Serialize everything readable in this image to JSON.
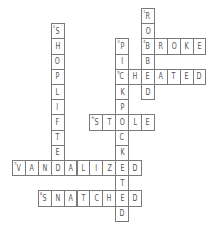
{
  "puzzle": {
    "grid": {
      "origin_x": 12,
      "origin_y": 8,
      "cell_w": 12.9,
      "cell_h": 15.2
    },
    "colors": {
      "border": "#7a7a7a",
      "letter": "#555555",
      "background": "#ffffff"
    },
    "words": [
      {
        "number": "1",
        "answer": "ROBBED",
        "direction": "down",
        "row": 0,
        "col": 10
      },
      {
        "number": "2",
        "answer": "SHOPLIFTED",
        "direction": "down",
        "row": 1,
        "col": 3
      },
      {
        "number": "3",
        "answer": "PICKPOCKETED",
        "direction": "down",
        "row": 2,
        "col": 8
      },
      {
        "number": "4",
        "answer": "BROKE",
        "direction": "across",
        "row": 2,
        "col": 10
      },
      {
        "number": "5",
        "answer": "CHEATED",
        "direction": "across",
        "row": 4,
        "col": 8
      },
      {
        "number": "6",
        "answer": "STOLE",
        "direction": "across",
        "row": 7,
        "col": 6
      },
      {
        "number": "7",
        "answer": "VANDALIZED",
        "direction": "across",
        "row": 10,
        "col": 0
      },
      {
        "number": "8",
        "answer": "SNATCHED",
        "direction": "across",
        "row": 12,
        "col": 2
      }
    ]
  }
}
